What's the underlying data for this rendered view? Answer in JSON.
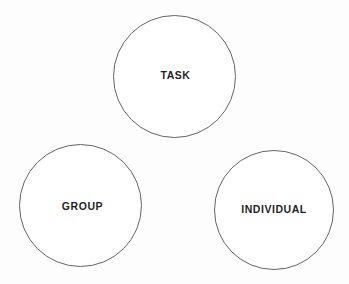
{
  "diagram": {
    "type": "three-circle-venn-layout",
    "background_color": "#fdfdfd",
    "circle_fill_color": "#ffffff",
    "circle_stroke_color": "#63636a",
    "label_color": "#1f1f24",
    "nodes": [
      {
        "id": "task",
        "label": "TASK",
        "position": "top-center",
        "center_x": 175,
        "center_y": 77,
        "diameter": 123
      },
      {
        "id": "group",
        "label": "GROUP",
        "position": "bottom-left",
        "center_x": 81,
        "center_y": 206,
        "diameter": 123
      },
      {
        "id": "individual",
        "label": "INDIVIDUAL",
        "position": "bottom-right",
        "center_x": 274,
        "center_y": 210,
        "diameter": 120
      }
    ]
  }
}
